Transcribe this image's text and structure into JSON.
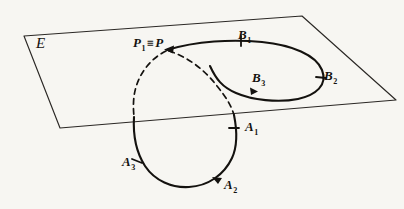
{
  "figure": {
    "kind": "geometric-diagram",
    "background_color": "#f7f6f2",
    "ink_color": "#14120f",
    "plane": {
      "name": "E",
      "label": "E",
      "vertices": "24,36 302,16 396,100 60,128"
    },
    "labels": {
      "plane": "E",
      "point_p": {
        "base": "P",
        "sub": "1",
        "relation": "≡",
        "tail": "P",
        "full": "P₁ ≡ P"
      },
      "b1": {
        "base": "B",
        "sub": "1",
        "full": "B₁"
      },
      "b2": {
        "base": "B",
        "sub": "2",
        "full": "B₂"
      },
      "b3": {
        "base": "B",
        "sub": "3",
        "full": "B₃"
      },
      "a1": {
        "base": "A",
        "sub": "1",
        "full": "A₁"
      },
      "a2": {
        "base": "A",
        "sub": "2",
        "full": "A₂"
      },
      "a3": {
        "base": "A",
        "sub": "3",
        "full": "A₃"
      }
    },
    "curves": {
      "b_loop_solid": "loop lying above/on the plane through B1, B2, B3 ending at P",
      "a_loop_solid": "loop below the plane through A1, A2, A3",
      "a_loop_hidden": "dashed portion of the A loop occluded by the plane"
    },
    "tick_marks": [
      "B1",
      "B2",
      "B3",
      "A1",
      "A2",
      "A3"
    ],
    "arrowheads": [
      "at P pointing left along the B curve",
      "at B3",
      "at A2"
    ]
  }
}
